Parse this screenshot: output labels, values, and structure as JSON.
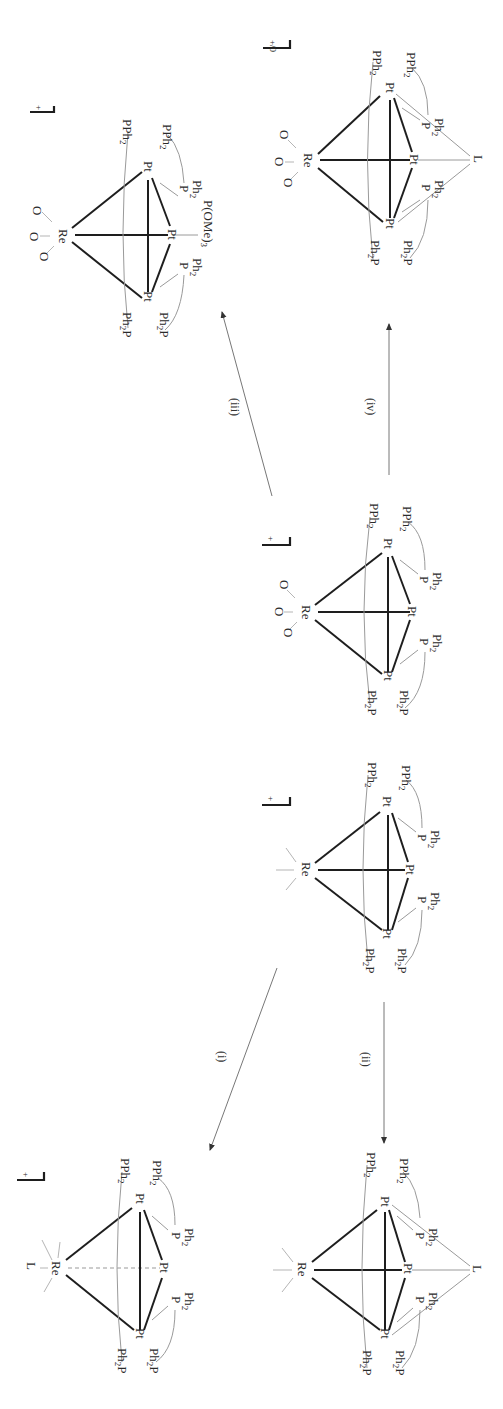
{
  "figure": {
    "type": "reaction-scheme",
    "orientation": "rotated-90-clockwise",
    "background": "#ffffff",
    "bond_color": "#1e1e1e",
    "ligand_line_color": "#9a9a9a"
  },
  "atoms": {
    "re": "Re",
    "pt": "Pt",
    "o": "O",
    "l": "L",
    "pph2_main": "PPh",
    "ph2p_main": "Ph",
    "p": "P",
    "ph": "Ph",
    "sub2": "2",
    "sub3": "3",
    "pome_main": "P(OMe)",
    "ph2p_p": "P"
  },
  "charges": {
    "plus": "+",
    "plus_zero": "+/0"
  },
  "reactions": [
    {
      "id": "i",
      "label": "(i)",
      "from": "Re3Pt... starting complex (ReCO3)",
      "to": "L-Re adduct"
    },
    {
      "id": "ii",
      "label": "(ii)",
      "from": "starting complex (ReCO3)",
      "to": "Pt3-L bridged complex"
    },
    {
      "id": "iii",
      "label": "(iii)",
      "from": "ReO3 complex",
      "to": "P(OMe)3 adduct"
    },
    {
      "id": "iv",
      "label": "(iv)",
      "from": "ReO3 complex",
      "to": "Pt3-L bridged ReO3 complex"
    }
  ],
  "compounds": [
    {
      "name": "ReO3-Pt3-P(OMe)3",
      "charge": "+",
      "ligands": [
        "O",
        "O",
        "O",
        "PPh2",
        "PPh2",
        "Ph2P",
        "Ph2P",
        "P Ph2",
        "P Ph2",
        "P(OMe)3"
      ]
    },
    {
      "name": "ReO3-Pt3-L",
      "charge": "+/0",
      "ligands": [
        "O",
        "O",
        "O",
        "PPh2",
        "PPh2",
        "Ph2P",
        "Ph2P",
        "P Ph2",
        "P Ph2",
        "L"
      ]
    },
    {
      "name": "ReO3-Pt3",
      "charge": "+",
      "ligands": [
        "O",
        "O",
        "O",
        "PPh2",
        "PPh2",
        "Ph2P",
        "Ph2P",
        "P Ph2",
        "P Ph2"
      ]
    },
    {
      "name": "Re(CO)3-Pt3",
      "charge": "+",
      "ligands": [
        "PPh2",
        "PPh2",
        "Ph2P",
        "Ph2P",
        "P Ph2",
        "P Ph2"
      ]
    },
    {
      "name": "L-Re(CO)3-Pt3",
      "charge": "+",
      "ligands": [
        "L",
        "PPh2",
        "PPh2",
        "Ph2P",
        "Ph2P",
        "P Ph2",
        "P Ph2"
      ]
    },
    {
      "name": "Re(CO)3-Pt3-L",
      "charge": "+",
      "ligands": [
        "PPh2",
        "PPh2",
        "Ph2P",
        "Ph2P",
        "P Ph2",
        "P Ph2",
        "L"
      ]
    }
  ]
}
